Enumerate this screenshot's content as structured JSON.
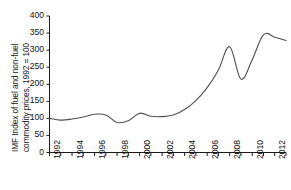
{
  "chart_data": {
    "type": "line",
    "title": "",
    "xlabel": "",
    "ylabel": "IMF Index of fuel and non-fuel commodity prices, 1992 = 100",
    "ylabel_line1": "IMF Index of fuel and non-fuel",
    "ylabel_line2": "commodity prices, 1992 = 100",
    "ylim": [
      0,
      400
    ],
    "ytick_step": 50,
    "yticks": [
      0,
      50,
      100,
      150,
      200,
      250,
      300,
      350,
      400
    ],
    "ytick_labels": [
      "0",
      "50",
      "100",
      "150",
      "200",
      "250",
      "300",
      "350",
      "400"
    ],
    "xlim": [
      1992,
      2013
    ],
    "xticks": [
      1992,
      1993,
      1994,
      1995,
      1996,
      1997,
      1998,
      1999,
      2000,
      2001,
      2002,
      2003,
      2004,
      2005,
      2006,
      2007,
      2008,
      2009,
      2010,
      2011,
      2012,
      2013
    ],
    "xtick_labels_shown": [
      "1992",
      "1994",
      "1996",
      "1998",
      "2000",
      "2002",
      "2004",
      "2006",
      "2008",
      "2010",
      "2012"
    ],
    "xtick_label_rotation": -90,
    "grid": false,
    "legend": false,
    "legend_position": "none",
    "line_color": "#4d4d4d",
    "axis_color": "#1a1a1a",
    "x": [
      1992,
      1993,
      1994,
      1995,
      1996,
      1997,
      1998,
      1999,
      2000,
      2001,
      2002,
      2003,
      2004,
      2005,
      2006,
      2007,
      2008,
      2009,
      2010,
      2011,
      2012,
      2013
    ],
    "values": [
      100,
      95,
      98,
      104,
      112,
      110,
      88,
      93,
      115,
      106,
      105,
      110,
      126,
      152,
      190,
      242,
      310,
      215,
      272,
      345,
      338,
      328
    ],
    "series": [
      {
        "name": "IMF commodity price index",
        "values": [
          100,
          95,
          98,
          104,
          112,
          110,
          88,
          93,
          115,
          106,
          105,
          110,
          126,
          152,
          190,
          242,
          310,
          215,
          272,
          345,
          338,
          328
        ]
      }
    ],
    "annotations": []
  }
}
